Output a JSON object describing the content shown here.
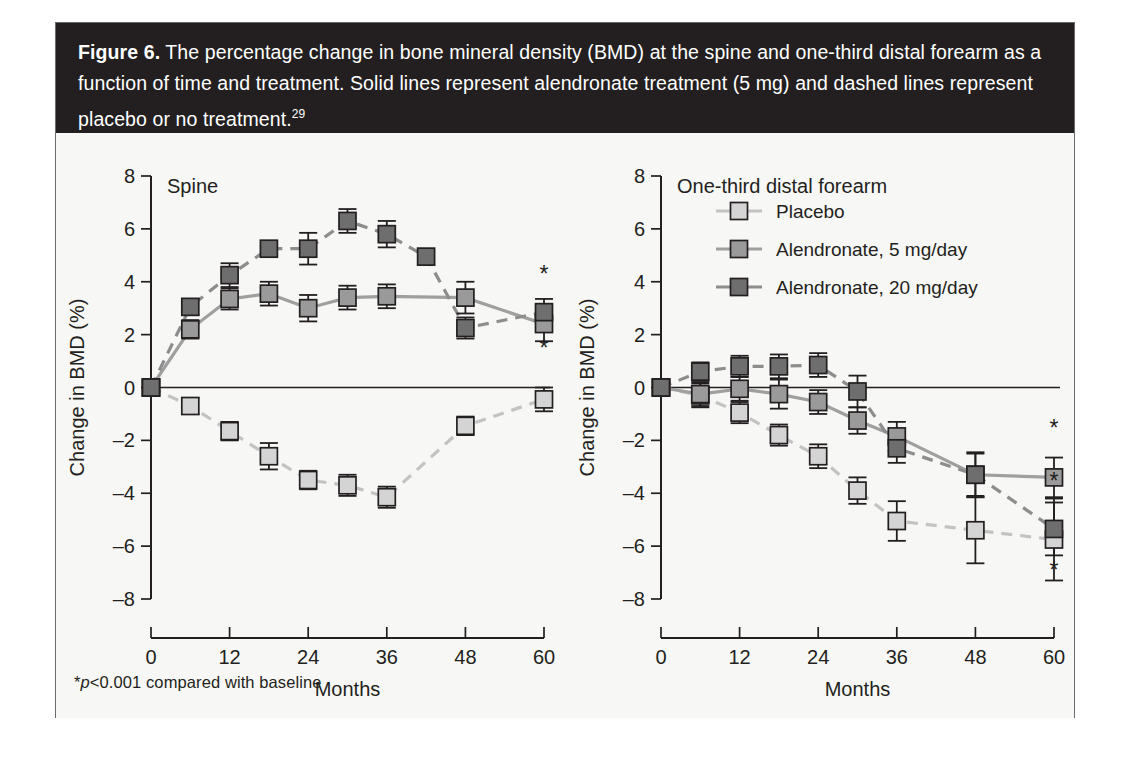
{
  "caption": {
    "figure_label": "Figure 6.",
    "text": " The percentage change in bone mineral density (BMD) at the spine and one-third distal forearm as a function of time and treatment. Solid lines represent alendronate treatment (5 mg) and dashed lines represent placebo or no treatment.",
    "reference": "29"
  },
  "footnote": {
    "star": "*",
    "italic_p": "p",
    "rest": "<0.001 compared with baseline"
  },
  "legend": {
    "position": "top-right-of-forearm-panel",
    "entries": [
      {
        "label": "Placebo",
        "color": "#d4d4d4",
        "line": "dashed"
      },
      {
        "label": "Alendronate, 5 mg/day",
        "color": "#9a9a9a",
        "line": "solid"
      },
      {
        "label": "Alendronate, 20 mg/day",
        "color": "#6e6e6e",
        "line": "dashed"
      }
    ]
  },
  "colors": {
    "placebo": "#d4d4d4",
    "alendronate_5": "#9a9a9a",
    "alendronate_20": "#6e6e6e",
    "line_placebo": "#c3c3c3",
    "line_5": "#9f9f9f",
    "line_20": "#8d8d8d",
    "ink": "#231f20",
    "caption_bg": "#231f20",
    "panel_bg": "#f7f7f5",
    "frame_border": "#6b6b6b"
  },
  "chart_data": [
    {
      "type": "line",
      "title": "Spine",
      "xlabel": "Months",
      "ylabel": "Change in BMD (%)",
      "xlim": [
        0,
        60
      ],
      "ylim": [
        -8,
        8
      ],
      "xticks": [
        0,
        12,
        24,
        36,
        48,
        60
      ],
      "xticklabels": [
        "0",
        "12",
        "24",
        "36",
        "48",
        "60"
      ],
      "yticks": [
        8,
        6,
        4,
        2,
        0,
        -2,
        -4,
        -6,
        -8
      ],
      "yticklabels": [
        "8",
        "6",
        "4",
        "2",
        "0",
        "–2",
        "–4",
        "–6",
        "–8"
      ],
      "grid": false,
      "zero_line": true,
      "annotations": [
        {
          "text": "*",
          "x": 60,
          "y": 4.0
        },
        {
          "text": "*",
          "x": 60,
          "y": 1.2
        }
      ],
      "series": [
        {
          "name": "Placebo",
          "color": "#d4d4d4",
          "line": "dashed",
          "x": [
            0,
            6,
            12,
            18,
            24,
            30,
            36,
            48,
            60
          ],
          "values": [
            0.0,
            -0.7,
            -1.65,
            -2.6,
            -3.5,
            -3.7,
            -4.15,
            -1.45,
            -0.45
          ],
          "errors": [
            0.2,
            0.3,
            0.35,
            0.5,
            0.35,
            0.4,
            0.4,
            0.35,
            0.45
          ]
        },
        {
          "name": "Alendronate, 5 mg/day",
          "color": "#9a9a9a",
          "line": "solid",
          "x": [
            0,
            6,
            12,
            18,
            24,
            30,
            36,
            48,
            60
          ],
          "values": [
            0.0,
            2.2,
            3.35,
            3.55,
            3.0,
            3.4,
            3.45,
            3.4,
            2.4
          ],
          "errors": [
            0.2,
            0.35,
            0.4,
            0.45,
            0.5,
            0.45,
            0.45,
            0.6,
            0.65
          ]
        },
        {
          "name": "Alendronate, 20 mg/day",
          "color": "#6e6e6e",
          "line": "dashed",
          "x": [
            0,
            6,
            12,
            24,
            30,
            36,
            48,
            60
          ],
          "values": [
            0.0,
            3.05,
            4.25,
            5.25,
            6.3,
            5.8,
            2.25,
            2.85
          ],
          "errors": [
            0.2,
            0.3,
            0.45,
            0.6,
            0.45,
            0.5,
            0.4,
            0.5
          ],
          "extra_points": [
            {
              "x": 18,
              "y": 5.25
            },
            {
              "x": 42,
              "y": 4.95
            }
          ]
        }
      ]
    },
    {
      "type": "line",
      "title": "One-third distal forearm",
      "xlabel": "Months",
      "ylabel": "Change in BMD (%)",
      "xlim": [
        0,
        60
      ],
      "ylim": [
        -8,
        8
      ],
      "xticks": [
        0,
        12,
        24,
        36,
        48,
        60
      ],
      "xticklabels": [
        "0",
        "12",
        "24",
        "36",
        "48",
        "60"
      ],
      "yticks": [
        8,
        6,
        4,
        2,
        0,
        -2,
        -4,
        -6,
        -8
      ],
      "yticklabels": [
        "8",
        "6",
        "4",
        "2",
        "0",
        "–2",
        "–4",
        "–6",
        "–8"
      ],
      "grid": false,
      "zero_line": true,
      "annotations": [
        {
          "text": "*",
          "x": 60,
          "y": -1.85
        },
        {
          "text": "*",
          "x": 60,
          "y": -3.85
        },
        {
          "text": "*",
          "x": 60,
          "y": -7.2
        }
      ],
      "series": [
        {
          "name": "Placebo",
          "color": "#d4d4d4",
          "line": "dashed",
          "x": [
            0,
            6,
            12,
            18,
            24,
            30,
            36,
            48,
            60
          ],
          "values": [
            0.0,
            -0.3,
            -0.95,
            -1.8,
            -2.6,
            -3.9,
            -5.05,
            -5.4,
            -5.75
          ],
          "errors": [
            0.25,
            0.45,
            0.4,
            0.4,
            0.45,
            0.5,
            0.75,
            1.25,
            1.55
          ]
        },
        {
          "name": "Alendronate, 5 mg/day",
          "color": "#9a9a9a",
          "line": "solid",
          "x": [
            0,
            6,
            12,
            18,
            24,
            30,
            36,
            48,
            60
          ],
          "values": [
            0.0,
            -0.25,
            -0.05,
            -0.25,
            -0.55,
            -1.25,
            -1.85,
            -3.3,
            -3.4
          ],
          "errors": [
            0.25,
            0.45,
            0.45,
            0.55,
            0.45,
            0.5,
            0.55,
            0.85,
            0.75
          ]
        },
        {
          "name": "Alendronate, 20 mg/day",
          "color": "#6e6e6e",
          "line": "dashed",
          "x": [
            0,
            6,
            12,
            18,
            24,
            30,
            36,
            48,
            60
          ],
          "values": [
            0.0,
            0.6,
            0.8,
            0.8,
            0.85,
            -0.15,
            -2.3,
            -3.3,
            -5.35
          ],
          "errors": [
            0.25,
            0.35,
            0.4,
            0.45,
            0.45,
            0.6,
            0.55,
            0.8,
            1.0
          ]
        }
      ]
    }
  ]
}
